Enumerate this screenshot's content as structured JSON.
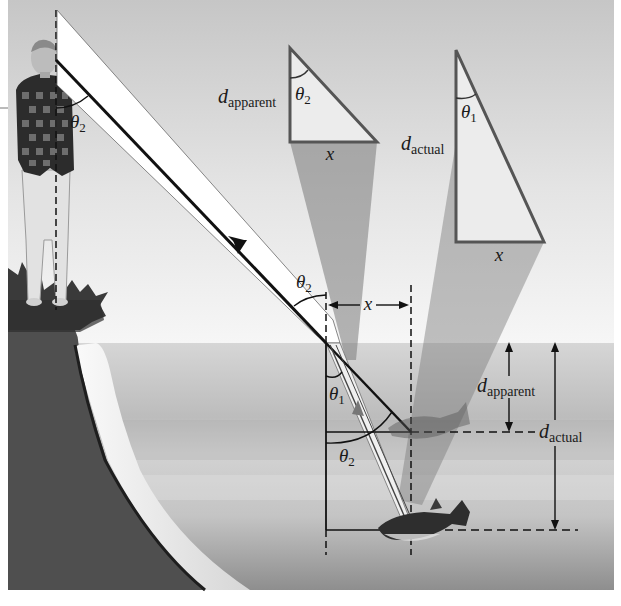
{
  "figure": {
    "colors": {
      "sky_top": "#c4c4c4",
      "sky_bottom": "#f2f2f2",
      "water_top": "#d0d0d0",
      "water_bottom": "#8c8c8c",
      "bank": "#4e4e4e",
      "beam_fill": "#ffffff",
      "ray": "#111111",
      "triangle_stroke": "#555555",
      "cone_fill": "#7a7a7a"
    },
    "labels": {
      "theta2_eye": {
        "sym": "θ",
        "sub": "2"
      },
      "theta2_surface_air": {
        "sym": "θ",
        "sub": "2"
      },
      "theta1_water": {
        "sym": "θ",
        "sub": "1"
      },
      "theta2_water": {
        "sym": "θ",
        "sub": "2"
      },
      "x_dimension": "x",
      "d_apparent_arrow": {
        "sym": "d",
        "sub": "apparent"
      },
      "d_actual_arrow": {
        "sym": "d",
        "sub": "actual"
      }
    },
    "triangle_apparent": {
      "side_label": {
        "sym": "d",
        "sub": "apparent"
      },
      "angle_label": {
        "sym": "θ",
        "sub": "2"
      },
      "base_label": "x"
    },
    "triangle_actual": {
      "side_label": {
        "sym": "d",
        "sub": "actual"
      },
      "angle_label": {
        "sym": "θ",
        "sub": "1"
      },
      "base_label": "x"
    },
    "objects": [
      "observer-person",
      "grassy-bank",
      "fish-actual",
      "fish-apparent-image",
      "water-surface"
    ]
  }
}
